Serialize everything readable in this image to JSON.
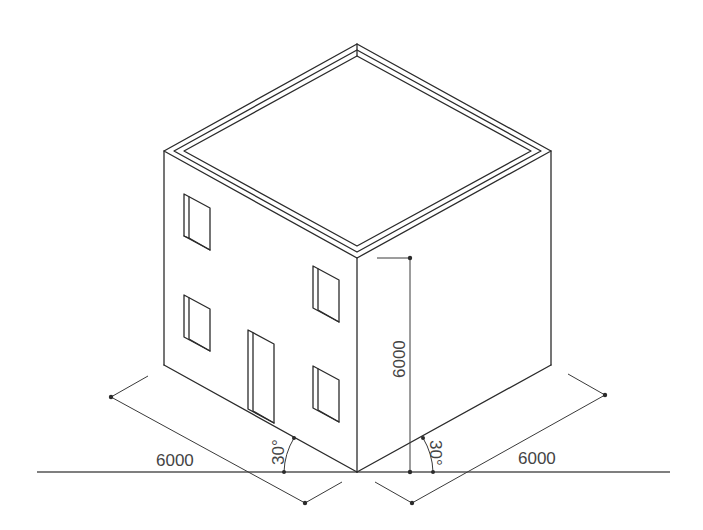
{
  "diagram": {
    "dimensions": {
      "left_width": "6000",
      "right_width": "6000",
      "height": "6000",
      "left_angle": "30°",
      "right_angle": "30°"
    },
    "colors": {
      "line": "#2b2b2b",
      "text": "#444444",
      "background": "#ffffff"
    }
  }
}
